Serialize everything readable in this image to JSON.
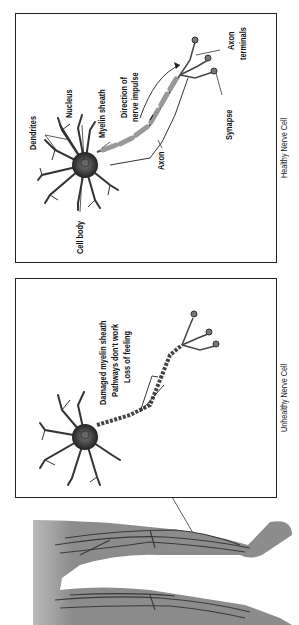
{
  "healthy_panel": {
    "caption": "Healthy Nerve Cell",
    "labels": {
      "dendrites": "Dendrites",
      "nucleus": "Nucleus",
      "myelin_sheath": "Myelin sheath",
      "direction_line1": "Direction of",
      "direction_line2": "nerve impulse",
      "axon": "Axon",
      "axon_terminals_line1": "Axon",
      "axon_terminals_line2": "terminals",
      "synapse": "Synapse",
      "cell_body": "Cell body"
    }
  },
  "unhealthy_panel": {
    "caption": "Unhealthy Nerve Cell",
    "labels": {
      "line1": "Damaged myelin sheath",
      "line2": "Pathways don't work",
      "line3": "Loss of feeling"
    }
  },
  "legs_illustration": {
    "description": "legs-with-nerves"
  },
  "colors": {
    "frame": "#222222",
    "leg_fill": "#8a8a8a",
    "nerve": "#333333",
    "myelin": "#b0b0b0"
  }
}
